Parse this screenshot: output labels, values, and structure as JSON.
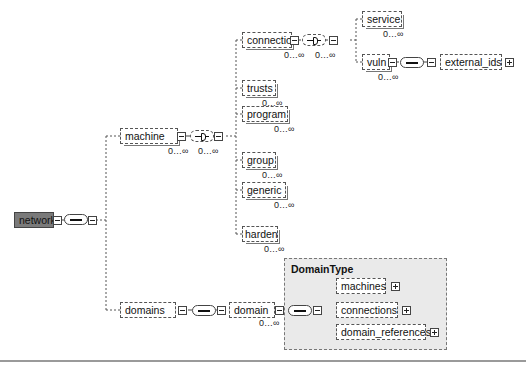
{
  "diagram": {
    "type": "xml-schema-tree",
    "root": {
      "label": "network",
      "fill": "#7a7a7a"
    },
    "nodes": {
      "machine": {
        "label": "machine",
        "cardinality": "0…∞",
        "compositor_cardinality": "0…∞"
      },
      "connection": {
        "label": "connection",
        "cardinality": "0…∞",
        "compositor_cardinality": "0…∞"
      },
      "service": {
        "label": "service",
        "cardinality": "0…∞"
      },
      "vuln": {
        "label": "vuln",
        "cardinality": "0…∞"
      },
      "external_ids": {
        "label": "external_ids"
      },
      "trusts": {
        "label": "trusts",
        "cardinality": "0…∞"
      },
      "program": {
        "label": "program",
        "cardinality": "0…∞"
      },
      "group": {
        "label": "group",
        "cardinality": "0…∞"
      },
      "generic": {
        "label": "generic",
        "cardinality": "0…∞"
      },
      "harden": {
        "label": "harden",
        "cardinality": "0…∞"
      },
      "domains": {
        "label": "domains"
      },
      "domain": {
        "label": "domain",
        "cardinality": "0…∞"
      },
      "machines": {
        "label": "machines"
      },
      "connections": {
        "label": "connections"
      },
      "domain_references": {
        "label": "domain_references"
      }
    },
    "group": {
      "title": "DomainType",
      "fill": "#eaeaea"
    }
  }
}
